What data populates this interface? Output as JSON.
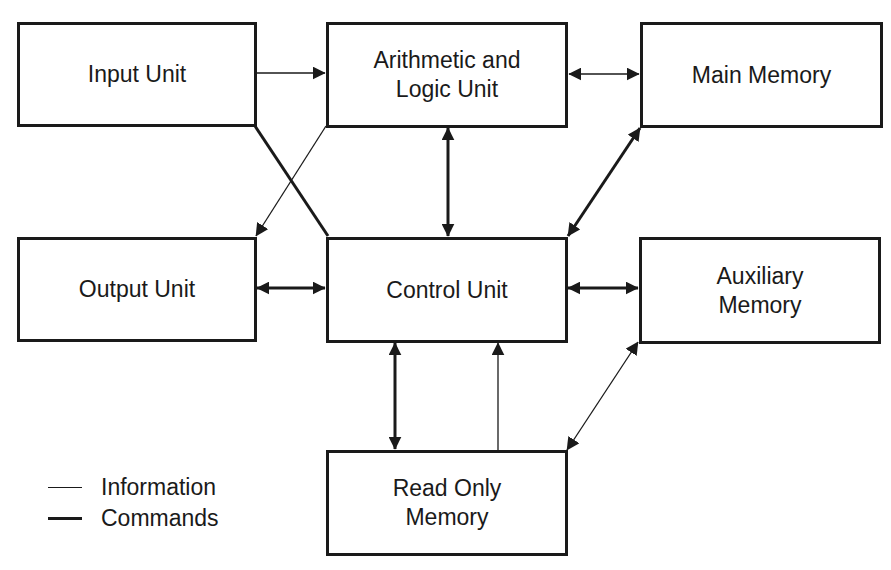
{
  "diagram": {
    "type": "block-diagram",
    "colors": {
      "stroke": "#1a1a1a",
      "background": "#ffffff"
    },
    "nodes": {
      "input_unit": {
        "label": "Input Unit"
      },
      "alu": {
        "label": "Arithmetic and\nLogic Unit"
      },
      "main_memory": {
        "label": "Main Memory"
      },
      "output_unit": {
        "label": "Output Unit"
      },
      "control_unit": {
        "label": "Control Unit"
      },
      "auxiliary_memory": {
        "label": "Auxiliary\nMemory"
      },
      "rom": {
        "label": "Read Only\nMemory"
      }
    },
    "edges": [
      {
        "from": "Input Unit",
        "to": "Arithmetic and Logic Unit",
        "kind": "Information",
        "direction": "one-way"
      },
      {
        "from": "Arithmetic and Logic Unit",
        "to": "Main Memory",
        "kind": "Information",
        "direction": "two-way"
      },
      {
        "from": "Arithmetic and Logic Unit",
        "to": "Output Unit",
        "kind": "Information",
        "direction": "one-way"
      },
      {
        "from": "Input Unit",
        "to": "Control Unit",
        "kind": "Commands",
        "direction": "none"
      },
      {
        "from": "Arithmetic and Logic Unit",
        "to": "Control Unit",
        "kind": "Commands",
        "direction": "two-way"
      },
      {
        "from": "Main Memory",
        "to": "Control Unit",
        "kind": "Commands",
        "direction": "two-way"
      },
      {
        "from": "Output Unit",
        "to": "Control Unit",
        "kind": "Commands",
        "direction": "two-way"
      },
      {
        "from": "Control Unit",
        "to": "Auxiliary Memory",
        "kind": "Commands",
        "direction": "two-way"
      },
      {
        "from": "Control Unit",
        "to": "Read Only Memory",
        "kind": "Commands",
        "direction": "two-way"
      },
      {
        "from": "Read Only Memory",
        "to": "Control Unit",
        "kind": "Information",
        "direction": "one-way"
      },
      {
        "from": "Auxiliary Memory",
        "to": "Read Only Memory",
        "kind": "Information",
        "direction": "two-way"
      }
    ],
    "legend": {
      "information": "Information",
      "commands": "Commands"
    }
  }
}
